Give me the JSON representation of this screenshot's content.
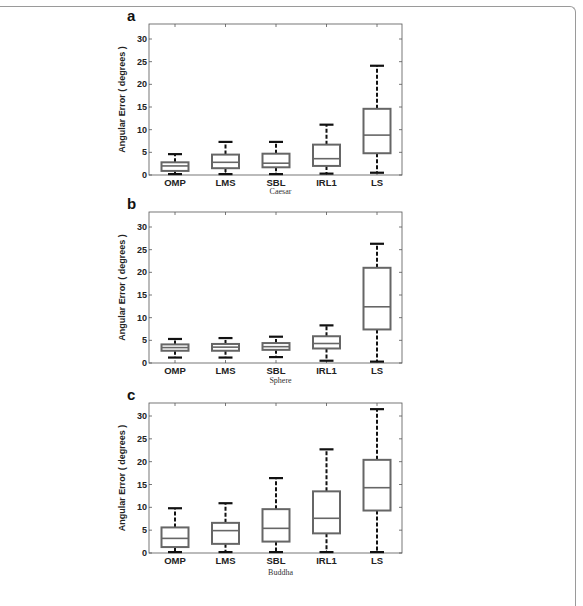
{
  "figure": {
    "frame_color": "#9a9a9a",
    "box_color": "#666666",
    "whisker_color": "#111111",
    "axis_color": "#555555"
  },
  "chart_data": [
    {
      "type": "box",
      "panel": "a",
      "title": "",
      "caption": "Caesar",
      "xlabel": "Caesar",
      "ylabel": "Angular Error ( degrees )",
      "ylim": [
        0,
        32
      ],
      "yticks": [
        0,
        5,
        10,
        15,
        20,
        25,
        30
      ],
      "categories": [
        "OMP",
        "LMS",
        "SBL",
        "IRL1",
        "LS"
      ],
      "boxes": [
        {
          "name": "OMP",
          "whisker_low": 0.2,
          "q1": 0.9,
          "median": 2.0,
          "q3": 2.8,
          "whisker_high": 4.6
        },
        {
          "name": "LMS",
          "whisker_low": 0.2,
          "q1": 1.5,
          "median": 2.8,
          "q3": 4.5,
          "whisker_high": 7.3
        },
        {
          "name": "SBL",
          "whisker_low": 0.2,
          "q1": 1.7,
          "median": 2.6,
          "q3": 4.7,
          "whisker_high": 7.3
        },
        {
          "name": "IRL1",
          "whisker_low": 0.3,
          "q1": 2.0,
          "median": 3.6,
          "q3": 6.7,
          "whisker_high": 11.1
        },
        {
          "name": "LS",
          "whisker_low": 0.5,
          "q1": 4.8,
          "median": 8.8,
          "q3": 14.6,
          "whisker_high": 24.1
        }
      ]
    },
    {
      "type": "box",
      "panel": "b",
      "title": "",
      "caption": "Sphere",
      "xlabel": "Sphere",
      "ylabel": "Angular Error ( degrees )",
      "ylim": [
        0,
        32
      ],
      "yticks": [
        0,
        5,
        10,
        15,
        20,
        25,
        30
      ],
      "categories": [
        "OMP",
        "LMS",
        "SBL",
        "IRL1",
        "LS"
      ],
      "boxes": [
        {
          "name": "OMP",
          "whisker_low": 1.2,
          "q1": 2.7,
          "median": 3.4,
          "q3": 4.1,
          "whisker_high": 5.3
        },
        {
          "name": "LMS",
          "whisker_low": 1.2,
          "q1": 2.7,
          "median": 3.5,
          "q3": 4.2,
          "whisker_high": 5.5
        },
        {
          "name": "SBL",
          "whisker_low": 1.3,
          "q1": 2.9,
          "median": 3.6,
          "q3": 4.4,
          "whisker_high": 5.8
        },
        {
          "name": "IRL1",
          "whisker_low": 0.5,
          "q1": 3.2,
          "median": 4.3,
          "q3": 5.9,
          "whisker_high": 8.3
        },
        {
          "name": "LS",
          "whisker_low": 0.3,
          "q1": 7.4,
          "median": 12.4,
          "q3": 21.0,
          "whisker_high": 26.3
        }
      ]
    },
    {
      "type": "box",
      "panel": "c",
      "title": "",
      "caption": "Buddha",
      "xlabel": "Buddha",
      "ylabel": "Angular Error ( degrees )",
      "ylim": [
        0,
        32
      ],
      "yticks": [
        0,
        5,
        10,
        15,
        20,
        25,
        30
      ],
      "categories": [
        "OMP",
        "LMS",
        "SBL",
        "IRL1",
        "LS"
      ],
      "boxes": [
        {
          "name": "OMP",
          "whisker_low": 0.2,
          "q1": 1.3,
          "median": 3.2,
          "q3": 5.6,
          "whisker_high": 9.8
        },
        {
          "name": "LMS",
          "whisker_low": 0.2,
          "q1": 2.0,
          "median": 4.9,
          "q3": 6.6,
          "whisker_high": 10.9
        },
        {
          "name": "SBL",
          "whisker_low": 0.2,
          "q1": 2.5,
          "median": 5.4,
          "q3": 9.6,
          "whisker_high": 16.4
        },
        {
          "name": "IRL1",
          "whisker_low": 0.2,
          "q1": 4.3,
          "median": 7.6,
          "q3": 13.5,
          "whisker_high": 22.7
        },
        {
          "name": "LS",
          "whisker_low": 0.2,
          "q1": 9.3,
          "median": 14.3,
          "q3": 20.4,
          "whisker_high": 31.5
        }
      ]
    }
  ]
}
